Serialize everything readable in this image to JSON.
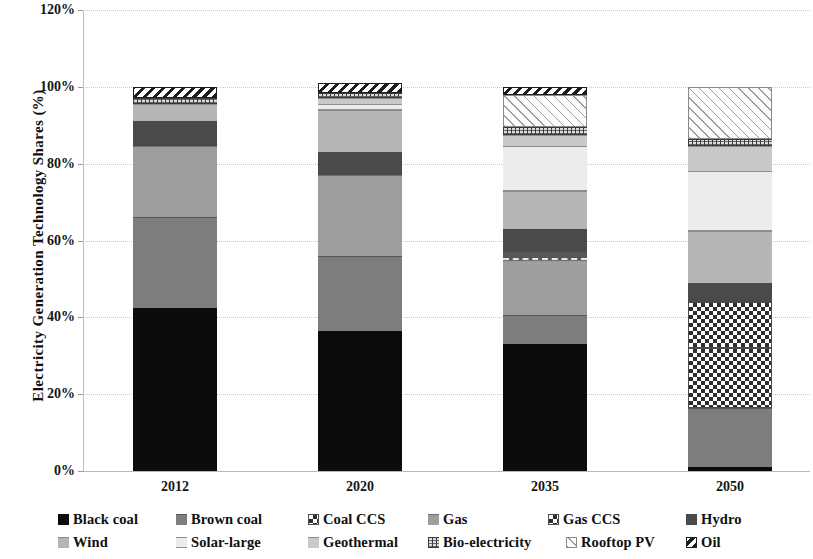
{
  "chart_data": {
    "type": "bar",
    "stacked": true,
    "title": "",
    "xlabel": "",
    "ylabel": "Electricity Generation Technology Shares (%)",
    "categories": [
      "2012",
      "2020",
      "2035",
      "2050"
    ],
    "ylim": [
      0,
      120
    ],
    "yticks": [
      "0%",
      "20%",
      "40%",
      "60%",
      "80%",
      "100%",
      "120%"
    ],
    "ytick_values": [
      0,
      20,
      40,
      60,
      80,
      100,
      120
    ],
    "grid": true,
    "legend_position": "bottom",
    "series": [
      {
        "name": "Black coal",
        "color": "#0c0c0c",
        "pattern": "solid",
        "values": [
          42.5,
          36.5,
          33.0,
          1.0
        ]
      },
      {
        "name": "Brown coal",
        "color": "#7d7d7d",
        "pattern": "solid",
        "values": [
          23.5,
          19.5,
          7.5,
          15.5
        ]
      },
      {
        "name": "Coal CCS",
        "color": "#2e2e2e",
        "pattern": "checker",
        "values": [
          0,
          0,
          0,
          15.5
        ]
      },
      {
        "name": "Gas",
        "color": "#9e9e9e",
        "pattern": "solid",
        "values": [
          18.5,
          21.0,
          14.5,
          0
        ]
      },
      {
        "name": "Gas CCS",
        "color": "#2e2e2e",
        "pattern": "checker",
        "values": [
          0,
          0,
          2.0,
          12.0
        ]
      },
      {
        "name": "Hydro",
        "color": "#4a4a4a",
        "pattern": "solid",
        "values": [
          6.5,
          6.0,
          6.0,
          5.0
        ]
      },
      {
        "name": "Wind",
        "color": "#b6b6b6",
        "pattern": "solid",
        "values": [
          4.5,
          11.0,
          10.0,
          13.5
        ]
      },
      {
        "name": "Solar-large",
        "color": "#ececec",
        "pattern": "solid",
        "values": [
          0,
          1.5,
          11.5,
          15.5
        ]
      },
      {
        "name": "Geothermal",
        "color": "#c9c9c9",
        "pattern": "solid",
        "values": [
          0,
          1.5,
          3.0,
          6.5
        ]
      },
      {
        "name": "Bio-electricity",
        "color": "#dcdcdc",
        "pattern": "dotted-texture",
        "values": [
          1.5,
          1.5,
          2.0,
          2.0
        ]
      },
      {
        "name": "Rooftop PV",
        "color": "#fdfdfd",
        "pattern": "light-hatch",
        "values": [
          0,
          0,
          8.5,
          13.5
        ]
      },
      {
        "name": "Oil",
        "color": "#ffffff",
        "pattern": "diagonal-hatch",
        "values": [
          3.0,
          2.5,
          2.0,
          0
        ]
      }
    ],
    "column_totals": [
      100.0,
      100.0,
      100.0,
      100.0
    ]
  },
  "axis": {
    "y_title": "Electricity Generation Technology Shares (%)",
    "y_ticks": [
      {
        "label": "120%",
        "value": 120
      },
      {
        "label": "100%",
        "value": 100
      },
      {
        "label": "80%",
        "value": 80
      },
      {
        "label": "60%",
        "value": 60
      },
      {
        "label": "40%",
        "value": 40
      },
      {
        "label": "20%",
        "value": 20
      },
      {
        "label": "0%",
        "value": 0
      }
    ],
    "x_ticks": [
      {
        "label": "2012"
      },
      {
        "label": "2020"
      },
      {
        "label": "2035"
      },
      {
        "label": "2050"
      }
    ]
  },
  "legend": {
    "rows": [
      [
        {
          "label": "Black coal",
          "icon": "legend-swatch-black-coal"
        },
        {
          "label": "Brown coal",
          "icon": "legend-swatch-brown-coal"
        },
        {
          "label": "Coal CCS",
          "icon": "legend-swatch-coal-ccs"
        },
        {
          "label": "Gas",
          "icon": "legend-swatch-gas"
        },
        {
          "label": "Gas CCS",
          "icon": "legend-swatch-gas-ccs"
        },
        {
          "label": "Hydro",
          "icon": "legend-swatch-hydro"
        }
      ],
      [
        {
          "label": "Wind",
          "icon": "legend-swatch-wind"
        },
        {
          "label": "Solar-large",
          "icon": "legend-swatch-solar-large"
        },
        {
          "label": "Geothermal",
          "icon": "legend-swatch-geothermal"
        },
        {
          "label": "Bio-electricity",
          "icon": "legend-swatch-bio-electricity"
        },
        {
          "label": "Rooftop PV",
          "icon": "legend-swatch-rooftop-pv"
        },
        {
          "label": "Oil",
          "icon": "legend-swatch-oil"
        }
      ]
    ]
  }
}
